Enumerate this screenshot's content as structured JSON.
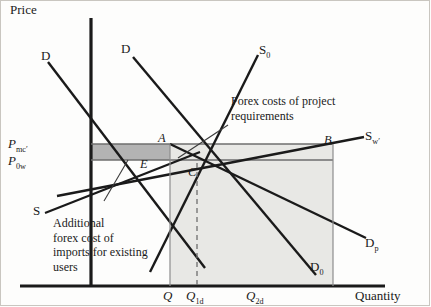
{
  "figure": {
    "axes": {
      "y_label": "Price",
      "x_label": "Quantity"
    },
    "price_ticks": [
      {
        "name": "p-mc",
        "label": "P",
        "sub": "mc′"
      },
      {
        "name": "p-0w",
        "label": "P",
        "sub": "0w"
      }
    ],
    "quantity_ticks": [
      {
        "name": "q",
        "label": "Q",
        "sub": ""
      },
      {
        "name": "q-1d",
        "label": "Q",
        "sub": "1d"
      },
      {
        "name": "q-2d",
        "label": "Q",
        "sub": "2d"
      }
    ],
    "curves": [
      {
        "name": "demand-left",
        "label": "D",
        "sub": ""
      },
      {
        "name": "demand-right",
        "label": "D",
        "sub": ""
      },
      {
        "name": "supply-domestic",
        "label": "S",
        "sub": "0"
      },
      {
        "name": "supply-world-adj",
        "label": "S",
        "sub": "w′"
      },
      {
        "name": "supply-low",
        "label": "S",
        "sub": ""
      },
      {
        "name": "demand-p",
        "label": "D",
        "sub": "p"
      },
      {
        "name": "demand-0",
        "label": "D",
        "sub": "0"
      }
    ],
    "points": [
      {
        "name": "point-a",
        "label": "A"
      },
      {
        "name": "point-b",
        "label": "B"
      },
      {
        "name": "point-c",
        "label": "C"
      },
      {
        "name": "point-e",
        "label": "E"
      }
    ],
    "annotations": [
      {
        "name": "forex-project-note",
        "lines": [
          "Forex costs of project",
          "requirements"
        ]
      },
      {
        "name": "additional-forex-note",
        "lines": [
          "Additional",
          "forex cost of",
          "imports for existing",
          "users"
        ]
      }
    ],
    "colors": {
      "line": "#1a1a1a",
      "shade_band": "#b9b9b9",
      "shade_area": "#e3e3e0",
      "frame": "#c9c6c0"
    }
  }
}
